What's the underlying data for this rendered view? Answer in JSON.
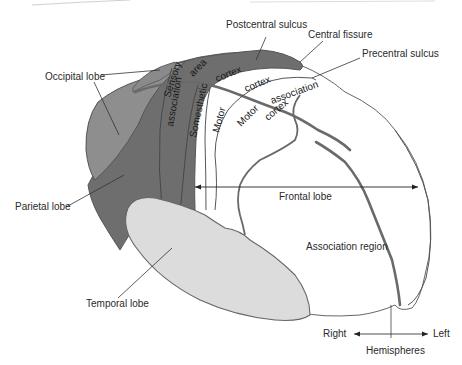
{
  "diagram": {
    "title": "",
    "colors": {
      "background": "#ffffff",
      "occipital_lobe": "#8c8c8c",
      "parietal_lobe": "#6e6e6e",
      "sensory_strip": "#777777",
      "temporal_lobe": "#dcdcdc",
      "frontal_lobe": "#ffffff",
      "outline": "#555555",
      "label_text": "#2a2a2a"
    },
    "callouts": {
      "postcentral_sulcus": "Postcentral sulcus",
      "central_fissure": "Central fissure",
      "precentral_sulcus": "Precentral sulcus",
      "occipital_lobe": "Occipital lobe",
      "parietal_lobe": "Parietal lobe",
      "temporal_lobe": "Temporal lobe",
      "frontal_lobe": "Frontal lobe",
      "association_region": "Association region",
      "hemispheres": "Hemispheres",
      "right": "Right",
      "left": "Left"
    },
    "region_text": {
      "sensory": "Sensory",
      "area": "area",
      "association_1": "association",
      "somesthetic": "Somesthetic",
      "cortex_1": "cortex",
      "motor_1": "Motor",
      "cortex_2": "cortex",
      "motor_2": "Motor",
      "association_2": "association",
      "cortex_3": "cortex"
    }
  }
}
